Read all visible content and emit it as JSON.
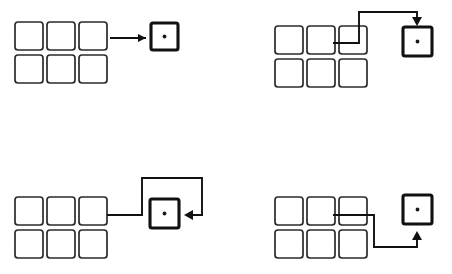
{
  "diagram": {
    "background_color": "#ffffff",
    "line_color": "#111111",
    "grid_stroke_color": "#2b2b2b",
    "dot_color": "#1a1a1a",
    "panel_count": 4,
    "panels": [
      {
        "id": "panel-top-left",
        "label": "Straight connector entering left side",
        "grid": {
          "label": "Six-cell grid",
          "columns": 3,
          "rows": 2,
          "cell_count": 6,
          "cells": [
            "",
            "",
            "",
            "",
            "",
            ""
          ]
        },
        "target": {
          "label": "Target node",
          "marker": "center-dot",
          "marker_text": ""
        },
        "connector": {
          "label": "Straight arrow",
          "route": "straight",
          "entry_side": "left",
          "segments": 1,
          "path": "M 110 38 L 146 38",
          "arrow_points": "146,38 138,34 138,42"
        }
      },
      {
        "id": "panel-top-right",
        "label": "Elbow connector entering top side",
        "grid": {
          "label": "Six-cell grid",
          "columns": 3,
          "rows": 2,
          "cell_count": 6,
          "cells": [
            "",
            "",
            "",
            "",
            "",
            ""
          ]
        },
        "target": {
          "label": "Target node",
          "marker": "center-dot",
          "marker_text": ""
        },
        "connector": {
          "label": "Elbow arrow over the top",
          "route": "right-up-right-down",
          "entry_side": "top",
          "segments": 4,
          "path": "M 107 43 L 133 43 L 133 12 L 191 12 L 191 24",
          "arrow_points": "191,26 186,17 196,17"
        }
      },
      {
        "id": "panel-bottom-left",
        "label": "Wrap-around connector entering right side",
        "grid": {
          "label": "Six-cell grid",
          "columns": 3,
          "rows": 2,
          "cell_count": 6,
          "cells": [
            "",
            "",
            "",
            "",
            "",
            ""
          ]
        },
        "target": {
          "label": "Target node",
          "marker": "center-dot",
          "marker_text": ""
        },
        "connector": {
          "label": "Wrap-around arrow from the right",
          "route": "right-up-right-down-left",
          "entry_side": "right",
          "segments": 5,
          "path": "M 107 78 L 142 78 L 142 41 L 202 41 L 202 78 L 186 78",
          "arrow_points": "184,78 193,73 193,83"
        }
      },
      {
        "id": "panel-bottom-right",
        "label": "Under-route connector entering bottom side",
        "grid": {
          "label": "Six-cell grid",
          "columns": 3,
          "rows": 2,
          "cell_count": 6,
          "cells": [
            "",
            "",
            "",
            "",
            "",
            ""
          ]
        },
        "target": {
          "label": "Under-route arrow from below",
          "marker": "center-dot",
          "marker_text": ""
        },
        "connector": {
          "label": "Under-route arrow",
          "route": "right-down-right-up",
          "entry_side": "bottom",
          "segments": 4,
          "path": "M 107 78 L 148 78 L 148 110 L 191 110 L 191 96",
          "arrow_points": "191,94 186,103 196,103"
        }
      }
    ]
  }
}
